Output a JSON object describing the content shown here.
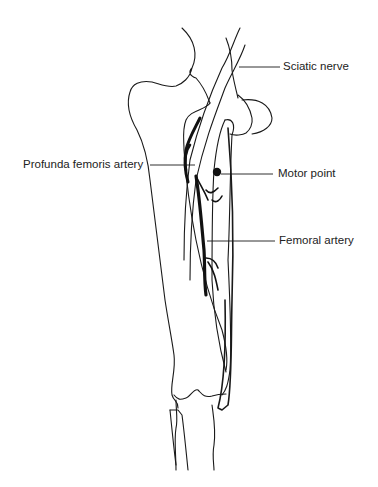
{
  "figure": {
    "labels": [
      {
        "id": "sciatic",
        "text": "Sciatic nerve"
      },
      {
        "id": "profunda",
        "text": "Profunda femoris artery"
      },
      {
        "id": "motor",
        "text": "Motor point"
      },
      {
        "id": "femoral",
        "text": "Femoral artery"
      }
    ]
  },
  "colors": {
    "ink": "#1a1a1a",
    "background": "#ffffff"
  }
}
